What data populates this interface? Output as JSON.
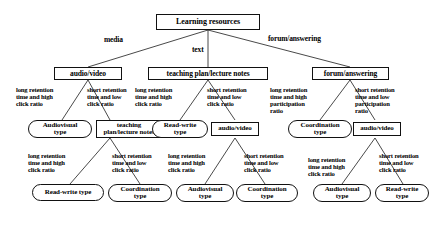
{
  "diagram": {
    "type": "decision-tree",
    "colors": {
      "stroke": "#111111",
      "text": "#000000",
      "background": "#ffffff"
    },
    "nodes": {
      "root": {
        "label": "Learning  resources",
        "shape": "rect"
      },
      "l2_left": {
        "label": "audio/video",
        "shape": "rect"
      },
      "l2_mid": {
        "label": "teaching plan/lecture notes",
        "shape": "rect"
      },
      "l2_right": {
        "label": "forum/answering",
        "shape": "rect"
      },
      "l3_a": {
        "label": "Audiovisual\ntype",
        "shape": "oval"
      },
      "l3_b": {
        "label": "teaching\nplan/lecture notes",
        "shape": "rect"
      },
      "l3_c": {
        "label": "Read-write\ntype",
        "shape": "oval"
      },
      "l3_d": {
        "label": "audio/video",
        "shape": "rect"
      },
      "l3_e": {
        "label": "Coordination\ntype",
        "shape": "oval"
      },
      "l3_f": {
        "label": "audio/video",
        "shape": "rect"
      },
      "l4_a": {
        "label": "Read-write type",
        "shape": "oval"
      },
      "l4_b": {
        "label": "Coordination\ntype",
        "shape": "oval"
      },
      "l4_c": {
        "label": "Audiovisual\ntype",
        "shape": "oval"
      },
      "l4_d": {
        "label": "Coordination\ntype",
        "shape": "oval"
      },
      "l4_e": {
        "label": "Audiovisual\ntype",
        "shape": "oval"
      },
      "l4_f": {
        "label": "Read-write\ntype",
        "shape": "oval"
      }
    },
    "edge_labels": {
      "media": "media",
      "text": "text",
      "forum_answering": "forum/answering",
      "e1": "long retention\ntime and high\nclick ratio",
      "e2": "short retention\ntime and low\nclick ratio",
      "e3": "long retention\ntime and high\nclick ratio",
      "e4": "short retention\ntime and low\nclick ratio",
      "e5": "long retention\ntime and high\nparticipation\nratio",
      "e6": "short retention\ntime and low\nparticipation\nratio",
      "e7": "long retention\ntime and high\nclick ratio",
      "e8": "short retention\ntime and low\nclick ratio",
      "e9": "long retention\ntime and high\nclick ratio",
      "e10": "short retention\ntime and low\nclick ratio",
      "e11": "long retention\ntime and high\nclick ratio",
      "e12": "short retention\ntime and low\nclick ratio"
    }
  }
}
